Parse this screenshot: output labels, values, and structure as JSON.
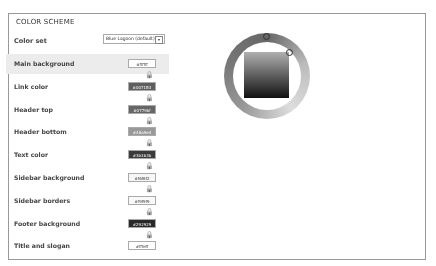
{
  "fieldset": {
    "legend": "COLOR SCHEME"
  },
  "color_set": {
    "label": "Color set",
    "value": "Blue Lagoon (default)"
  },
  "fields": [
    {
      "label": "Main background",
      "value": "#ffffff",
      "bg": "#ffffff",
      "fg": "#333"
    },
    {
      "label": "Link color",
      "value": "#0071B3",
      "bg": "#0071b3",
      "fg": "#fff"
    },
    {
      "label": "Header top",
      "value": "#0779bf",
      "bg": "#0779bf",
      "fg": "#fff"
    },
    {
      "label": "Header bottom",
      "value": "#48a9e4",
      "bg": "#48a9e4",
      "fg": "#fff"
    },
    {
      "label": "Text color",
      "value": "#3b3b3b",
      "bg": "#3b3b3b",
      "fg": "#fff"
    },
    {
      "label": "Sidebar background",
      "value": "#f6f6f2",
      "bg": "#f6f6f2",
      "fg": "#333"
    },
    {
      "label": "Sidebar borders",
      "value": "#f9f9f9",
      "bg": "#f9f9f9",
      "fg": "#333"
    },
    {
      "label": "Footer background",
      "value": "#292929",
      "bg": "#292929",
      "fg": "#fff"
    },
    {
      "label": "Title and slogan",
      "value": "#fffeff",
      "bg": "#fffeff",
      "fg": "#333"
    }
  ],
  "icons": {
    "lock": "lock-icon",
    "select_arrow": "▾"
  }
}
